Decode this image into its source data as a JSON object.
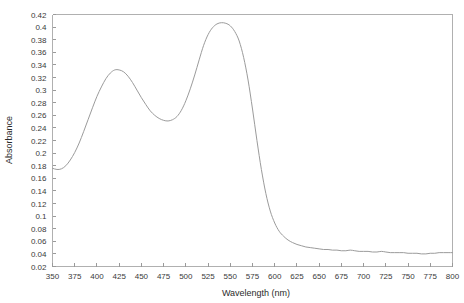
{
  "chart_data": {
    "type": "line",
    "title": "",
    "subtitle": "",
    "xlabel": "Wavelength (nm)",
    "ylabel": "Absorbance",
    "xlim": [
      350,
      800
    ],
    "ylim": [
      0.02,
      0.42
    ],
    "grid": false,
    "legend": null,
    "legend_position": "none",
    "x_ticks": [
      350,
      375,
      400,
      425,
      450,
      475,
      500,
      525,
      550,
      575,
      600,
      625,
      650,
      675,
      700,
      725,
      750,
      775,
      800
    ],
    "y_ticks": [
      0.02,
      0.04,
      0.06,
      0.08,
      0.1,
      0.12,
      0.14,
      0.16,
      0.18,
      0.2,
      0.22,
      0.24,
      0.26,
      0.28,
      0.3,
      0.32,
      0.34,
      0.36,
      0.38,
      0.4,
      0.42
    ],
    "x_tick_labels": [
      "350",
      "375",
      "400",
      "425",
      "450",
      "475",
      "500",
      "525",
      "550",
      "575",
      "600",
      "625",
      "650",
      "675",
      "700",
      "725",
      "750",
      "775",
      "800"
    ],
    "y_tick_labels": [
      "0.02",
      "0.04",
      "0.06",
      "0.08",
      "0.1",
      "0.12",
      "0.14",
      "0.16",
      "0.18",
      "0.2",
      "0.22",
      "0.24",
      "0.26",
      "0.28",
      "0.3",
      "0.32",
      "0.34",
      "0.36",
      "0.38",
      "0.4",
      "0.42"
    ],
    "series": [
      {
        "name": "absorbance-spectrum",
        "color": "#9b9b9b",
        "x": [
          350,
          355,
          360,
          365,
          370,
          375,
          380,
          385,
          390,
          395,
          400,
          405,
          410,
          415,
          420,
          425,
          430,
          435,
          440,
          445,
          450,
          455,
          460,
          465,
          470,
          475,
          480,
          485,
          490,
          495,
          500,
          505,
          510,
          515,
          520,
          525,
          530,
          535,
          540,
          545,
          550,
          555,
          560,
          565,
          570,
          575,
          580,
          585,
          590,
          595,
          600,
          605,
          610,
          615,
          620,
          625,
          630,
          635,
          640,
          645,
          650,
          655,
          660,
          665,
          670,
          675,
          680,
          685,
          690,
          695,
          700,
          705,
          710,
          715,
          720,
          725,
          730,
          735,
          740,
          745,
          750,
          755,
          760,
          765,
          770,
          775,
          780,
          785,
          790,
          795,
          800
        ],
        "y": [
          0.176,
          0.174,
          0.175,
          0.18,
          0.189,
          0.201,
          0.216,
          0.234,
          0.253,
          0.272,
          0.29,
          0.305,
          0.318,
          0.327,
          0.332,
          0.332,
          0.329,
          0.322,
          0.312,
          0.3,
          0.288,
          0.277,
          0.267,
          0.26,
          0.255,
          0.252,
          0.251,
          0.253,
          0.258,
          0.268,
          0.283,
          0.302,
          0.324,
          0.348,
          0.371,
          0.388,
          0.399,
          0.405,
          0.407,
          0.406,
          0.402,
          0.393,
          0.378,
          0.352,
          0.316,
          0.27,
          0.22,
          0.174,
          0.136,
          0.108,
          0.089,
          0.076,
          0.068,
          0.062,
          0.058,
          0.055,
          0.053,
          0.051,
          0.05,
          0.049,
          0.048,
          0.047,
          0.047,
          0.046,
          0.046,
          0.045,
          0.045,
          0.046,
          0.045,
          0.044,
          0.044,
          0.044,
          0.043,
          0.043,
          0.044,
          0.043,
          0.042,
          0.042,
          0.042,
          0.042,
          0.041,
          0.041,
          0.041,
          0.04,
          0.04,
          0.041,
          0.041,
          0.042,
          0.042,
          0.042,
          0.042
        ]
      }
    ],
    "annotations": [],
    "key_features": {
      "peak_1_wavelength": 425,
      "peak_1_absorbance": 0.332,
      "valley_wavelength": 480,
      "valley_absorbance": 0.251,
      "peak_2_wavelength": 540,
      "peak_2_absorbance": 0.407,
      "baseline_absorbance": 0.042
    }
  },
  "style": {
    "curve_color": "#9b9b9b",
    "frame_color": "#b0b0b0",
    "tick_color": "#9a9a9a",
    "text_color": "#3a3a3a",
    "background": "#ffffff"
  }
}
